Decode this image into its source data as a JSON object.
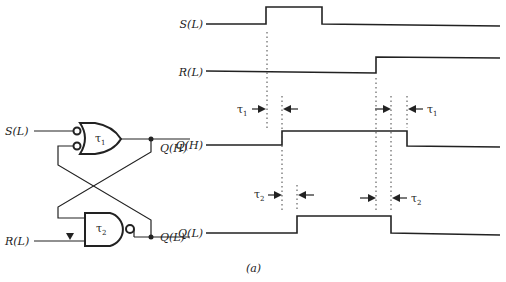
{
  "circuit": {
    "inputs": [
      "S(L)",
      "R(L)"
    ],
    "outputs": [
      "Q(H)",
      "Q(L)"
    ],
    "gate1": {
      "label": "τ",
      "sub": "1",
      "type": "OR with inverted inputs"
    },
    "gate2": {
      "label": "τ",
      "sub": "2",
      "type": "NAND"
    }
  },
  "timing": {
    "signals": [
      {
        "name": "S(L)",
        "low_y": 24,
        "high_y": 7,
        "edges": [
          266,
          322
        ],
        "initial": "low"
      },
      {
        "name": "R(L)",
        "low_y": 72,
        "high_y": 56,
        "edges": [
          376
        ],
        "initial": "low"
      },
      {
        "name": "Q(H)",
        "low_y": 145,
        "high_y": 131,
        "edges": [
          282,
          407
        ],
        "initial": "low"
      },
      {
        "name": "Q(L)",
        "low_y": 233,
        "high_y": 216,
        "edges": [
          297,
          391
        ],
        "initial": "low"
      }
    ],
    "delays": [
      {
        "label": "τ",
        "sub": "1",
        "from_x": 266,
        "to_x": 282
      },
      {
        "label": "τ",
        "sub": "1",
        "from_x": 391,
        "to_x": 407
      },
      {
        "label": "τ",
        "sub": "2",
        "from_x": 282,
        "to_x": 297
      },
      {
        "label": "τ",
        "sub": "2",
        "from_x": 376,
        "to_x": 391
      }
    ]
  },
  "caption": "(a)"
}
